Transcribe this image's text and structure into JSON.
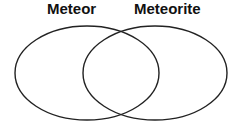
{
  "diagram": {
    "type": "venn",
    "sets": [
      {
        "label": "Meteor",
        "items": []
      },
      {
        "label": "Meteorite",
        "items": []
      }
    ],
    "intersection_items": [],
    "colors": {
      "stroke": "#222222",
      "text": "#111111",
      "background": "#ffffff"
    }
  }
}
